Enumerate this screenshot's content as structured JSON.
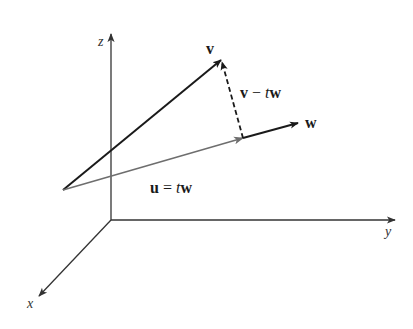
{
  "figure": {
    "axes": {
      "x_label": "x",
      "y_label": "y",
      "z_label": "z"
    },
    "vectors": {
      "v": {
        "label": "v"
      },
      "w": {
        "label": "w"
      },
      "u": {
        "label_bold1": "u",
        "label_eq": " = ",
        "label_t": "t",
        "label_bold2": "w"
      },
      "diff": {
        "label_bold1": "v",
        "label_minus": " − ",
        "label_t": "t",
        "label_bold2": "w"
      }
    },
    "colors": {
      "axis": "#333333",
      "v": "#1a1a1a",
      "u": "#6e6e6e",
      "w": "#1a1a1a",
      "dashed": "#1a1a1a"
    }
  }
}
